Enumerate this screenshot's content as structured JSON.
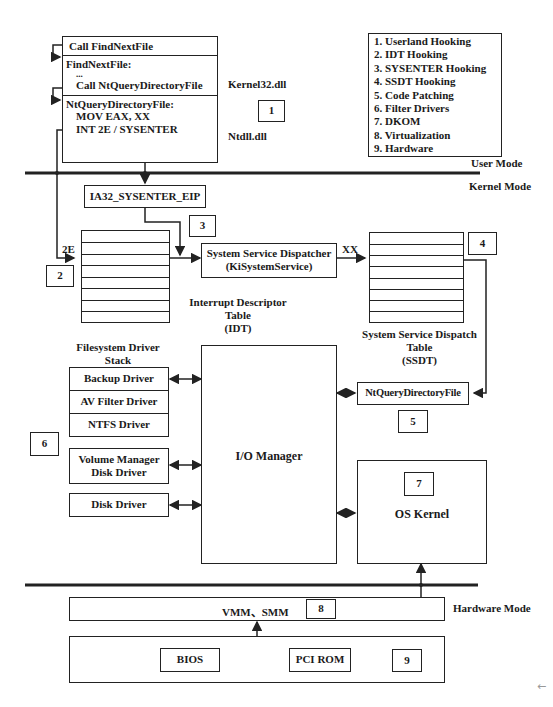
{
  "user_code": {
    "line1": "Call FindNextFile",
    "line2_title": "FindNextFile:",
    "line2_dots": "...",
    "line2_call": "Call NtQueryDirectoryFile",
    "line3_title": "NtQueryDirectoryFile:",
    "line3_mov": "MOV EAX, XX",
    "line3_int": "INT 2E / SYSENTER",
    "kernel32_label": "Kernel32.dll",
    "ntdll_label": "Ntdll.dll"
  },
  "legend": {
    "items": [
      "1. Userland Hooking",
      "2. IDT Hooking",
      "3. SYSENTER Hooking",
      "4. SSDT Hooking",
      "5. Code Patching",
      "6. Filter Drivers",
      "7. DKOM",
      "8. Virtualization",
      "9. Hardware"
    ]
  },
  "modes": {
    "user": "User Mode",
    "kernel": "Kernel Mode",
    "hardware": "Hardware Mode"
  },
  "markers": [
    "1",
    "2",
    "3",
    "4",
    "5",
    "6",
    "7",
    "8",
    "9"
  ],
  "kernel": {
    "sysenter_eip": "IA32_SYSENTER_EIP",
    "int_vector": "2E",
    "idt_label_1": "Interrupt Descriptor",
    "idt_label_2": "Table",
    "idt_label_3": "(IDT)",
    "dispatcher_1": "System Service Dispatcher",
    "dispatcher_2": "(KiSystemService)",
    "service_index": "XX",
    "ssdt_label_1": "System Service Dispatch",
    "ssdt_label_2": "Table",
    "ssdt_label_3": "(SSDT)",
    "ntquery": "NtQueryDirectoryFile",
    "io_manager": "I/O Manager",
    "os_kernel": "OS Kernel",
    "fs_stack_1": "Filesystem Driver",
    "fs_stack_2": "Stack",
    "drivers": {
      "backup": "Backup Driver",
      "av": "AV Filter Driver",
      "ntfs": "NTFS Driver",
      "volume_1": "Volume Manager",
      "volume_2": "Disk Driver",
      "disk": "Disk Driver"
    }
  },
  "hardware": {
    "vmm": "VMM、SMM",
    "bios": "BIOS",
    "pci_rom": "PCI ROM"
  },
  "side_arrow": "←"
}
